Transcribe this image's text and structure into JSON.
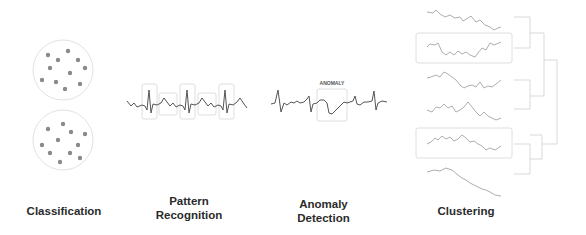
{
  "panels": [
    {
      "id": "classification",
      "label": "Classification"
    },
    {
      "id": "pattern",
      "label_line1": "Pattern",
      "label_line2": "Recognition"
    },
    {
      "id": "anomaly",
      "label_line1": "Anomaly",
      "label_line2": "Detection",
      "annotation": "ANOMALY"
    },
    {
      "id": "clustering",
      "label": "Clustering"
    }
  ],
  "colors": {
    "line": "#555555",
    "box": "#cfcfcf",
    "dot": "#8a8a8a",
    "text": "#2b2b2b"
  }
}
